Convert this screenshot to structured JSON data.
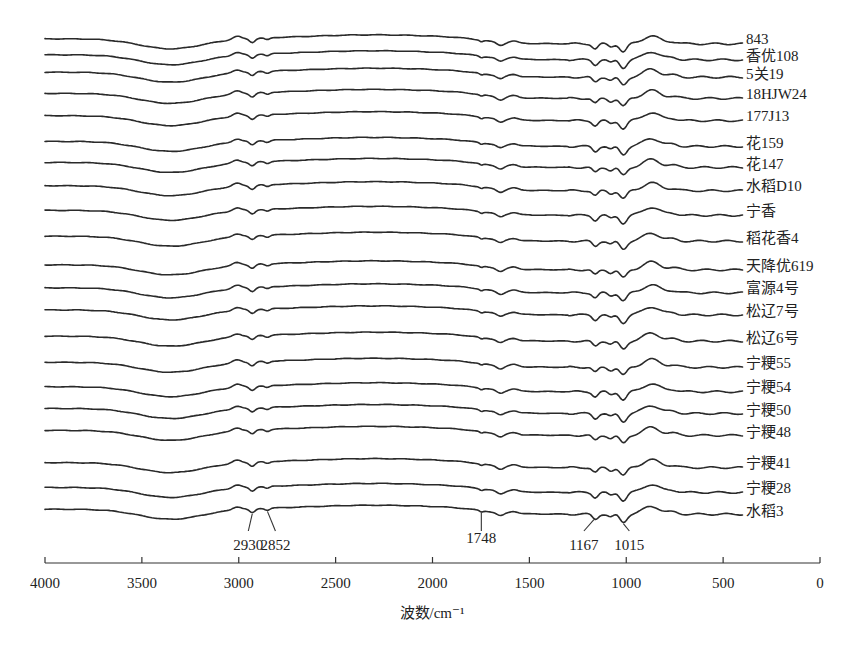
{
  "chart_data": {
    "type": "line",
    "title": "",
    "xlabel": "波数/cm⁻¹",
    "ylabel": "",
    "xlim": [
      4000,
      0
    ],
    "x_ticks": [
      4000,
      3500,
      3000,
      2500,
      2000,
      1500,
      1000,
      500,
      0
    ],
    "x_tick_labels": [
      "4000",
      "3500",
      "3000",
      "2500",
      "2000",
      "1500",
      "1000",
      "500",
      "0"
    ],
    "x_range_of_spectra": [
      4000,
      400
    ],
    "grid": false,
    "legend": "series labels at right end of each curve",
    "stacked_offset": true,
    "series": [
      {
        "name": "843"
      },
      {
        "name": "香优108"
      },
      {
        "name": "5关19"
      },
      {
        "name": "18HJW24"
      },
      {
        "name": "177J13"
      },
      {
        "name": "花159"
      },
      {
        "name": "花147"
      },
      {
        "name": "水稻D10"
      },
      {
        "name": "宁香"
      },
      {
        "name": "稻花香4"
      },
      {
        "name": "天降优619"
      },
      {
        "name": "富源4号"
      },
      {
        "name": "松辽7号"
      },
      {
        "name": "松辽6号"
      },
      {
        "name": "宁粳55"
      },
      {
        "name": "宁粳54"
      },
      {
        "name": "宁粳50"
      },
      {
        "name": "宁粳48"
      },
      {
        "name": "宁粳41"
      },
      {
        "name": "宁粳28"
      },
      {
        "name": "水稻3"
      }
    ],
    "annotations": [
      {
        "label": "2930",
        "x": 2930
      },
      {
        "label": "2852",
        "x": 2852
      },
      {
        "label": "1748",
        "x": 1748
      },
      {
        "label": "1167",
        "x": 1167
      },
      {
        "label": "1015",
        "x": 1015
      }
    ],
    "spectral_features": [
      {
        "x": 3400,
        "description": "broad O-H absorption band"
      },
      {
        "x": 2930,
        "description": "C-H stretch dip"
      },
      {
        "x": 2852,
        "description": "C-H stretch dip"
      },
      {
        "x": 1748,
        "description": "C=O absorption"
      },
      {
        "x": 1640,
        "description": "small dip"
      },
      {
        "x": 1167,
        "description": "C-O absorption"
      },
      {
        "x": 1015,
        "description": "strongest absorption dip"
      }
    ]
  }
}
